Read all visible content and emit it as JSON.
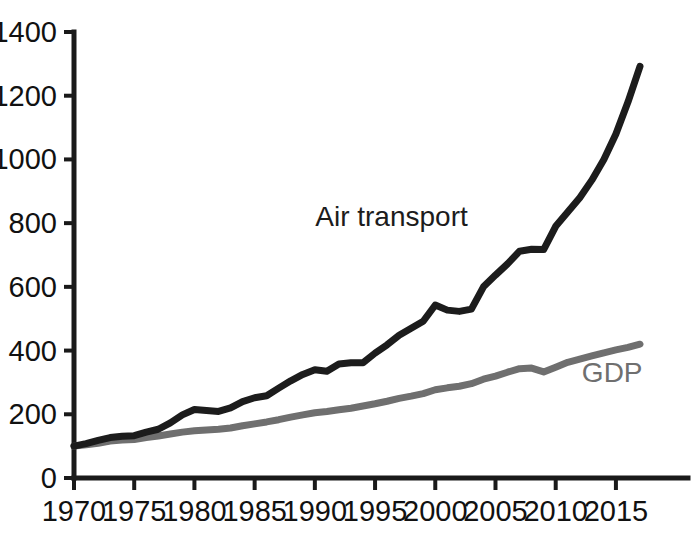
{
  "chart_data": {
    "type": "line",
    "title": "",
    "subtitle": "",
    "xlabel": "",
    "ylabel": "",
    "xlim": [
      1970,
      2017
    ],
    "ylim": [
      0,
      1400
    ],
    "grid": false,
    "legend_position": "inline-annotation",
    "x_tick_labels": [
      "1970",
      "1975",
      "1980",
      "1985",
      "1990",
      "1995",
      "2000",
      "2005",
      "2010",
      "2015"
    ],
    "x_ticks": [
      1970,
      1975,
      1980,
      1985,
      1990,
      1995,
      2000,
      2005,
      2010,
      2015
    ],
    "y_tick_labels": [
      "0",
      "200",
      "400",
      "600",
      "800",
      "1000",
      "1200",
      "1400"
    ],
    "y_ticks": [
      0,
      200,
      400,
      600,
      800,
      1000,
      1200,
      1400
    ],
    "x": [
      1970,
      1971,
      1972,
      1973,
      1974,
      1975,
      1976,
      1977,
      1978,
      1979,
      1980,
      1981,
      1982,
      1983,
      1984,
      1985,
      1986,
      1987,
      1988,
      1989,
      1990,
      1991,
      1992,
      1993,
      1994,
      1995,
      1996,
      1997,
      1998,
      1999,
      2000,
      2001,
      2002,
      2003,
      2004,
      2005,
      2006,
      2007,
      2008,
      2009,
      2010,
      2011,
      2012,
      2013,
      2014,
      2015,
      2016,
      2017
    ],
    "series": [
      {
        "name": "Air transport",
        "color": "#1c1c1c",
        "label_x": 2000,
        "label_y": 790,
        "values": [
          100,
          108,
          118,
          127,
          131,
          133,
          144,
          153,
          173,
          198,
          215,
          212,
          209,
          220,
          240,
          252,
          258,
          282,
          305,
          325,
          340,
          335,
          358,
          362,
          362,
          392,
          418,
          448,
          470,
          492,
          543,
          527,
          523,
          530,
          600,
          637,
          672,
          712,
          718,
          717,
          790,
          835,
          880,
          935,
          1000,
          1080,
          1180,
          1292
        ]
      },
      {
        "name": "GDP",
        "color": "#6f6f6f",
        "label_x": 2014,
        "label_y": 300,
        "values": [
          100,
          104,
          109,
          116,
          119,
          121,
          127,
          132,
          138,
          144,
          148,
          151,
          153,
          157,
          164,
          170,
          176,
          183,
          191,
          198,
          205,
          209,
          214,
          219,
          226,
          233,
          241,
          250,
          257,
          265,
          277,
          283,
          288,
          296,
          310,
          320,
          332,
          343,
          345,
          333,
          348,
          363,
          373,
          383,
          393,
          402,
          410,
          420
        ]
      }
    ]
  },
  "annotations": {
    "air_transport_label": "Air transport",
    "gdp_label": "GDP"
  }
}
